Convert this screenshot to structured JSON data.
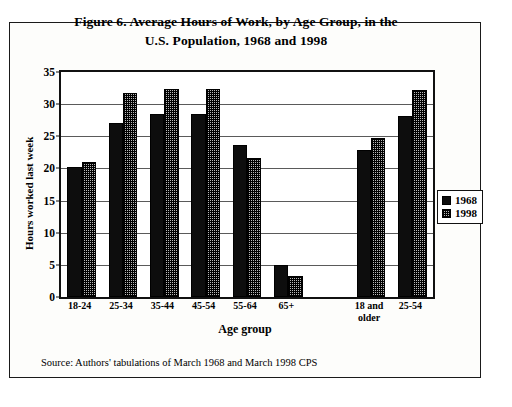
{
  "figure": {
    "title_line1": "Figure 6.  Average Hours of Work, by Age Group, in the",
    "title_line2": "U.S. Population, 1968 and 1998",
    "source_note": "Source:  Authors' tabulations of March 1968 and March 1998 CPS"
  },
  "legend": {
    "position": "right",
    "entries": [
      {
        "label": "1968",
        "swatch": "solid-black-swatch",
        "color": "#0d0d0d"
      },
      {
        "label": "1998",
        "swatch": "hatched-swatch",
        "color": "#b9b9b9"
      }
    ]
  },
  "chart_data": {
    "type": "bar",
    "title": "Figure 6.  Average Hours of Work, by Age Group, in the U.S. Population, 1968 and 1998",
    "xlabel": "Age group",
    "ylabel": "Hours worked last week",
    "ylim": [
      0,
      35
    ],
    "yticks": [
      0,
      5,
      10,
      15,
      20,
      25,
      30,
      35
    ],
    "ytick_labels": [
      "0",
      "5",
      "10",
      "15",
      "20",
      "25",
      "30",
      "35"
    ],
    "grid": true,
    "legend_position": "right",
    "categories": [
      "18-24",
      "25-34",
      "35-44",
      "45-54",
      "55-64",
      "65+",
      "18 and\nolder",
      "25-54"
    ],
    "category_labels": [
      "18-24",
      "25-34",
      "35-44",
      "45-54",
      "55-64",
      "65+",
      "18 and older",
      "25-54"
    ],
    "gap_after_category_index": 5,
    "series": [
      {
        "name": "1968",
        "values": [
          20.2,
          27.0,
          28.5,
          28.5,
          23.6,
          5.0,
          22.8,
          28.1
        ]
      },
      {
        "name": "1998",
        "values": [
          21.0,
          31.7,
          32.3,
          32.3,
          21.7,
          3.2,
          24.8,
          32.2
        ]
      }
    ]
  }
}
